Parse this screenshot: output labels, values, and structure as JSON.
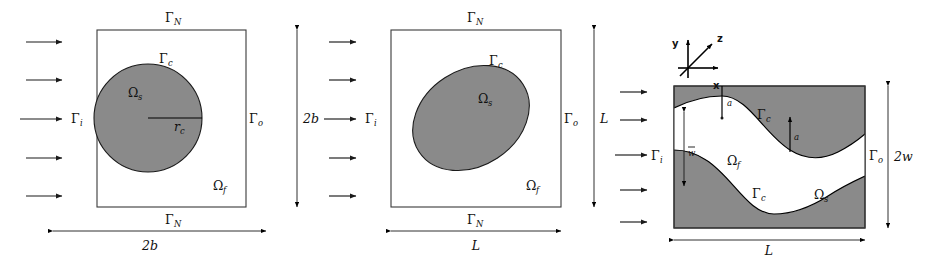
{
  "figure": {
    "panel_count": 3,
    "colors": {
      "solid_fill": "#8a8a8a",
      "fluid_fill": "#ffffff",
      "outline": "#3a3a3a",
      "annotation": "#111111",
      "background": "#ffffff"
    }
  },
  "symbols": {
    "gamma": "Γ",
    "omega": "Ω",
    "arrow_head": "triangle"
  },
  "panels": [
    {
      "id": "panel-circle",
      "name": "square-domain-circular-inclusion",
      "shape": "circle",
      "box": {
        "x": 97,
        "y": 30,
        "width": 149,
        "height": 177
      },
      "inclusion": {
        "cx": 148,
        "cy": 118,
        "r": 54
      },
      "labels": {
        "top_boundary": {
          "base": "Γ",
          "sub": "N"
        },
        "bottom_boundary": {
          "base": "Γ",
          "sub": "N"
        },
        "inlet": {
          "base": "Γ",
          "sub": "i"
        },
        "outlet": {
          "base": "Γ",
          "sub": "o"
        },
        "interface": {
          "base": "Γ",
          "sub": "c"
        },
        "solid_domain": {
          "base": "Ω",
          "sub": "s"
        },
        "fluid_domain": {
          "base": "Ω",
          "sub": "f"
        },
        "radius": {
          "base": "r",
          "sub": "c"
        }
      },
      "dimensions": {
        "horizontal": {
          "label": "2b",
          "value": "2b"
        },
        "vertical": {
          "label": "2b",
          "value": "2b"
        }
      },
      "inflow_arrows": 5
    },
    {
      "id": "panel-ellipse",
      "name": "square-domain-elliptical-inclusion",
      "shape": "ellipse",
      "box": {
        "x": 391,
        "y": 30,
        "width": 170,
        "height": 177
      },
      "inclusion": {
        "cx": 471,
        "cy": 118,
        "rx": 62,
        "ry": 48,
        "rotation_deg": -33
      },
      "labels": {
        "top_boundary": {
          "base": "Γ",
          "sub": "N"
        },
        "bottom_boundary": {
          "base": "Γ",
          "sub": "N"
        },
        "inlet": {
          "base": "Γ",
          "sub": "i"
        },
        "outlet": {
          "base": "Γ",
          "sub": "o"
        },
        "interface": {
          "base": "Γ",
          "sub": "c"
        },
        "solid_domain": {
          "base": "Ω",
          "sub": "s"
        },
        "fluid_domain": {
          "base": "Ω",
          "sub": "f"
        }
      },
      "dimensions": {
        "horizontal": {
          "label": "L",
          "value": "L"
        },
        "vertical": {
          "label": "L",
          "value": "L"
        }
      },
      "inflow_arrows": 5
    },
    {
      "id": "panel-wavy",
      "name": "wavy-channel-domain",
      "shape": "wavy-channel",
      "box": {
        "x": 674,
        "y": 86,
        "width": 191,
        "height": 142
      },
      "wave": {
        "periods": 1.5,
        "top_mean_offset": 34,
        "bottom_mean_offset": 34,
        "amplitude": 20,
        "phase": "antisymmetric"
      },
      "labels": {
        "inlet": {
          "base": "Γ",
          "sub": "i"
        },
        "outlet": {
          "base": "Γ",
          "sub": "o"
        },
        "interface_top": {
          "base": "Γ",
          "sub": "c"
        },
        "interface_bottom": {
          "base": "Γ",
          "sub": "c"
        },
        "solid_domain": {
          "base": "Ω",
          "sub": "s"
        },
        "fluid_domain": {
          "base": "Ω",
          "sub": "f"
        },
        "amplitude_top": "a",
        "amplitude_mid": "a",
        "mean_halfwidth": "w"
      },
      "dimensions": {
        "horizontal": {
          "label": "L",
          "value": "L"
        },
        "vertical": {
          "label": "2w",
          "value": "2w"
        }
      },
      "inflow_arrows": 5,
      "axes_triad": {
        "origin": {
          "x": 688,
          "y": 68
        },
        "axes": [
          {
            "name": "x",
            "label": "x",
            "direction": "right"
          },
          {
            "name": "y",
            "label": "y",
            "direction": "up"
          },
          {
            "name": "z",
            "label": "z",
            "direction": "up-right-diagonal"
          }
        ]
      }
    }
  ]
}
